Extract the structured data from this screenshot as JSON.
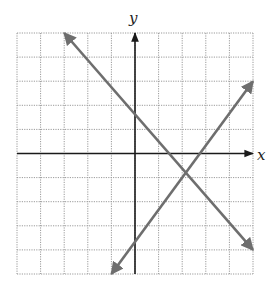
{
  "chart_data": {
    "type": "line",
    "title": "",
    "xlabel": "x",
    "ylabel": "y",
    "xlim": [
      -5,
      5
    ],
    "ylim": [
      -5,
      5
    ],
    "grid": true,
    "grid_step": 1,
    "legend": null,
    "series": [
      {
        "name": "decreasing line",
        "points": [
          [
            -3,
            5
          ],
          [
            5,
            -4
          ]
        ],
        "slope": -1.125,
        "y_intercept": 1.625,
        "x_intercept": 1.44,
        "arrows": "both",
        "color": "#6e6e6e"
      },
      {
        "name": "increasing line",
        "points": [
          [
            -1,
            -5
          ],
          [
            5,
            3
          ]
        ],
        "slope": 1.333,
        "y_intercept": -3.667,
        "x_intercept": 2.75,
        "arrows": "both",
        "color": "#6e6e6e"
      }
    ],
    "intersection": [
      2.15,
      -0.79
    ]
  },
  "labels": {
    "x_axis": "x",
    "y_axis": "y"
  },
  "colors": {
    "grid": "#9a9a9a",
    "axes": "#1a1a1a",
    "lines": "#6e6e6e"
  }
}
